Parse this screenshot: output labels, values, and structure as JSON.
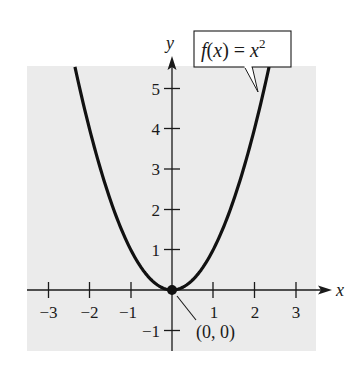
{
  "chart_data": {
    "type": "line",
    "title": "",
    "xlabel": "x",
    "ylabel": "y",
    "xlim": [
      -3.5,
      3.5
    ],
    "ylim": [
      -1.5,
      5.5
    ],
    "grid": false,
    "background": "#ebebeb",
    "x_ticks": [
      -3,
      -2,
      -1,
      1,
      2,
      3
    ],
    "x_tick_labels": [
      "−3",
      "−2",
      "−1",
      "1",
      "2",
      "3"
    ],
    "y_ticks": [
      -1,
      1,
      2,
      3,
      4,
      5
    ],
    "y_tick_labels": [
      "−1",
      "1",
      "2",
      "3",
      "4",
      "5"
    ],
    "series": [
      {
        "name": "f(x) = x^2",
        "label_text": "f(x) = x",
        "label_superscript": "2",
        "color": "#111111",
        "x": [
          -2.35,
          -2,
          -1.5,
          -1,
          -0.5,
          0,
          0.5,
          1,
          1.5,
          2,
          2.35
        ],
        "y": [
          5.52,
          4,
          2.25,
          1,
          0.25,
          0,
          0.25,
          1,
          2.25,
          4,
          5.52
        ]
      }
    ],
    "annotations": [
      {
        "text": "(0, 0)",
        "x": 0,
        "y": 0,
        "type": "point",
        "marker": "filled-circle"
      },
      {
        "text": "f(x) = x²",
        "type": "callout-box",
        "points_to": [
          2.25,
          5.06
        ]
      }
    ]
  },
  "labels": {
    "x_axis": "x",
    "y_axis": "y",
    "fn_main": "f(x) = x",
    "fn_sup": "2",
    "point": "(0, 0)",
    "xt0": "−3",
    "xt1": "−2",
    "xt2": "−1",
    "xt3": "1",
    "xt4": "2",
    "xt5": "3",
    "yt0": "5",
    "yt1": "4",
    "yt2": "3",
    "yt3": "2",
    "yt4": "1",
    "yt5": "−1"
  }
}
